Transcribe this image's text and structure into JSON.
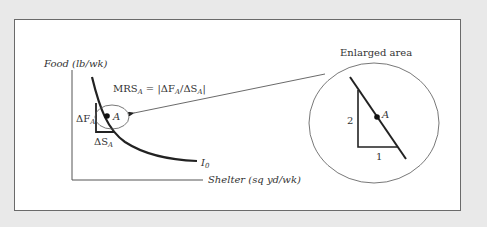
{
  "figure": {
    "axes": {
      "y_label": "Food (lb/wk)",
      "x_label": "Shelter (sq yd/wk)"
    },
    "curve_label_main": "I",
    "curve_label_sub": "0",
    "point_label": "A",
    "delta_f": {
      "main": "ΔF",
      "sub": "A"
    },
    "delta_s": {
      "main": "ΔS",
      "sub": "A"
    },
    "mrs_formula": {
      "mrs": "MRS",
      "mrs_sub": "A",
      "eq": " = |ΔF",
      "f_sub": "A",
      "slash": "/ΔS",
      "s_sub": "A",
      "close": "|"
    },
    "enlarged": {
      "title": "Enlarged area",
      "rise": "2",
      "run": "1",
      "point_label": "A"
    }
  },
  "colors": {
    "background": "#e9e9e9",
    "panel": "#ffffff",
    "ink": "#222222",
    "thin": "#555555"
  }
}
